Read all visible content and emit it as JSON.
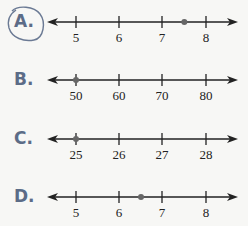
{
  "problem": {
    "selected_choice": "A",
    "choices": [
      {
        "letter": "A.",
        "ticks": [
          "5",
          "6",
          "7",
          "8"
        ],
        "point_value": 7.5,
        "tick_values": [
          5,
          6,
          7,
          8
        ],
        "circled": true
      },
      {
        "letter": "B.",
        "ticks": [
          "50",
          "60",
          "70",
          "80"
        ],
        "point_value": 50,
        "tick_values": [
          50,
          60,
          70,
          80
        ],
        "circled": false
      },
      {
        "letter": "C.",
        "ticks": [
          "25",
          "26",
          "27",
          "28"
        ],
        "point_value": 25,
        "tick_values": [
          25,
          26,
          27,
          28
        ],
        "circled": false
      },
      {
        "letter": "D.",
        "ticks": [
          "5",
          "6",
          "7",
          "8"
        ],
        "point_value": 6.5,
        "tick_values": [
          5,
          6,
          7,
          8
        ],
        "circled": false
      }
    ]
  },
  "colors": {
    "letter": "#5c6c87",
    "line": "#222222",
    "point": "#666666",
    "circle": "#6b7a94"
  }
}
